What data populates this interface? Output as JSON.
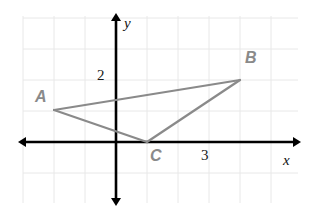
{
  "figure": {
    "kind": "coordinate-plane-triangle",
    "background_color": "#ffffff",
    "grid": {
      "show": true,
      "color": "#e8e8e8",
      "spacing_px": 31,
      "x_min_px": 23,
      "x_max_px": 298,
      "y_min_px": 16,
      "y_max_px": 203
    },
    "axes": {
      "color": "#000000",
      "origin_px": {
        "x": 116,
        "y": 142
      },
      "unit_px": 31,
      "x_axis_label": "x",
      "y_axis_label": "y",
      "x_axis_label_pos_px": {
        "x": 283,
        "y": 153
      },
      "y_axis_label_pos_px": {
        "x": 124,
        "y": 16
      },
      "arrows": [
        "left",
        "right",
        "up",
        "down"
      ]
    },
    "tick_labels": [
      {
        "text": "2",
        "axis": "y",
        "value": 2,
        "pos_px": {
          "x": 97,
          "y": 68
        }
      },
      {
        "text": "3",
        "axis": "x",
        "value": 3,
        "pos_px": {
          "x": 201,
          "y": 148
        }
      }
    ],
    "shape": {
      "name": "triangle-abc",
      "stroke_color": "#8a8a8a",
      "stroke_width_px": 2.2,
      "fill": "none",
      "vertices": [
        {
          "label": "A",
          "x": -2.0,
          "y": 1.05,
          "px": {
            "x": 54,
            "y": 110
          },
          "label_pos_px": {
            "x": 35,
            "y": 89
          }
        },
        {
          "label": "B",
          "x": 4.0,
          "y": 2.0,
          "px": {
            "x": 240,
            "y": 80
          },
          "label_pos_px": {
            "x": 245,
            "y": 50
          }
        },
        {
          "label": "C",
          "x": 1.0,
          "y": 0.0,
          "px": {
            "x": 147,
            "y": 142
          },
          "label_pos_px": {
            "x": 150,
            "y": 148
          }
        }
      ],
      "edges": [
        [
          "A",
          "B"
        ],
        [
          "B",
          "C"
        ],
        [
          "C",
          "A"
        ]
      ]
    }
  }
}
